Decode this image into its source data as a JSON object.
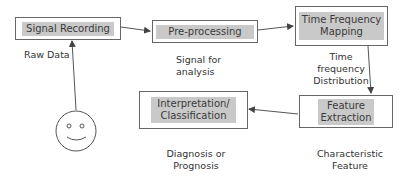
{
  "diagram": {
    "nodes": [
      {
        "id": "signal-recording",
        "label": "Signal Recording"
      },
      {
        "id": "pre-processing",
        "label": "Pre-processing"
      },
      {
        "id": "time-frequency-mapping",
        "label": "Time Frequency\nMapping"
      },
      {
        "id": "feature-extraction",
        "label": "Feature\nExtraction"
      },
      {
        "id": "interpretation-classification",
        "label": "Interpretation/\nClassification"
      }
    ],
    "annotations": {
      "raw_data": "Raw Data",
      "signal_for_analysis": "Signal for\nanalysis",
      "time_frequency_distribution": "Time\nfrequency\nDistribution",
      "characteristic_feature": "Characteristic\nFeature",
      "diagnosis_or_prognosis": "Diagnosis or\nPrognosis"
    },
    "edges": [
      {
        "from": "patient",
        "to": "signal-recording"
      },
      {
        "from": "signal-recording",
        "to": "pre-processing"
      },
      {
        "from": "pre-processing",
        "to": "time-frequency-mapping"
      },
      {
        "from": "time-frequency-mapping",
        "to": "feature-extraction"
      },
      {
        "from": "feature-extraction",
        "to": "interpretation-classification"
      }
    ],
    "actor_icon": "smiley-face-icon",
    "colors": {
      "box_border": "#666666",
      "box_fill": "#c9c9c9",
      "line": "#555555"
    }
  }
}
